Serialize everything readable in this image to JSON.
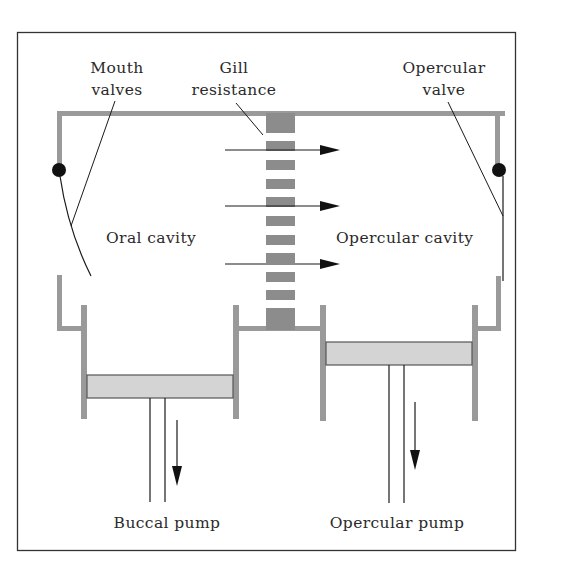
{
  "figure": {
    "type": "schematic"
  },
  "labels": {
    "mouth_valves": [
      "Mouth",
      "valves"
    ],
    "gill_resistance": [
      "Gill",
      "resistance"
    ],
    "opercular_valve": [
      "Opercular",
      "valve"
    ],
    "oral_cavity": "Oral cavity",
    "opercular_cavity": "Opercular cavity",
    "buccal_pump": "Buccal pump",
    "opercular_pump": "Opercular pump"
  },
  "flow_arrows": {
    "count": 3,
    "direction": "left-to-right"
  },
  "pump_arrows": {
    "buccal": "down",
    "opercular": "down"
  },
  "colors": {
    "wall": "#9a9a9a",
    "piston": "#d4d4d4",
    "gill_bars": "#8c8c8c",
    "ink": "#1a1a1a",
    "frame": "#333333"
  }
}
